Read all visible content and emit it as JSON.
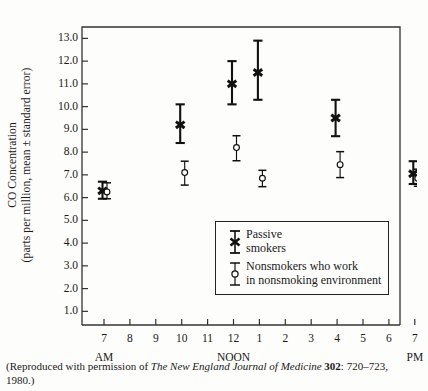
{
  "axes": {
    "y_title_line1": "CO Concentration",
    "y_title_line2": "(parts per million, mean ± standard error)",
    "y_ticks": [
      "13.0",
      "12.0",
      "11.0",
      "10.0",
      "9.0",
      "8.0",
      "7.0",
      "6.0",
      "5.0",
      "4.0",
      "3.0",
      "2.0",
      "1.0"
    ],
    "x_ticks": [
      "7",
      "8",
      "9",
      "10",
      "11",
      "12",
      "1",
      "2",
      "3",
      "4",
      "5",
      "6",
      "7"
    ],
    "period_am": "AM",
    "period_noon": "NOON",
    "period_pm": "PM"
  },
  "legend": {
    "series1_line1": "Passive",
    "series1_line2": "smokers",
    "series2_line1": "Nonsmokers who work",
    "series2_line2": "in nonsmoking environment"
  },
  "caption": {
    "pre": "(Reproduced with permission of ",
    "journal": "The New England Journal of Medicine",
    "volume": "302",
    "post": ": 720–723, 1980.)"
  },
  "colors": {
    "ink": "#1a1a1a",
    "frame": "#333333",
    "paper": "#fdfdfb"
  },
  "chart_data": {
    "type": "scatter",
    "title": "",
    "xlabel": "Time of day",
    "ylabel": "CO Concentration (parts per million, mean ± standard error)",
    "ylim": [
      0.4,
      13.5
    ],
    "xlim_hours": [
      "7 AM",
      "7 PM"
    ],
    "grid": false,
    "legend_position": "inside-lower-right",
    "x_categories": [
      "7 AM",
      "8 AM",
      "9 AM",
      "10 AM",
      "11 AM",
      "12 NOON",
      "1 PM",
      "2 PM",
      "3 PM",
      "4 PM",
      "5 PM",
      "6 PM",
      "7 PM"
    ],
    "series": [
      {
        "name": "Passive smokers",
        "marker": "filled-x",
        "points": [
          {
            "x_label": "7 AM",
            "x_index": 0,
            "y": 6.3,
            "lo": 5.95,
            "hi": 6.7
          },
          {
            "x_label": "10 AM",
            "x_index": 3,
            "y": 9.2,
            "lo": 8.4,
            "hi": 10.1
          },
          {
            "x_label": "12 NOON",
            "x_index": 5,
            "y": 11.0,
            "lo": 10.1,
            "hi": 12.0
          },
          {
            "x_label": "1 PM",
            "x_index": 6,
            "y": 11.5,
            "lo": 10.3,
            "hi": 12.9
          },
          {
            "x_label": "4 PM",
            "x_index": 9,
            "y": 9.5,
            "lo": 8.7,
            "hi": 10.3
          },
          {
            "x_label": "7 PM",
            "x_index": 12,
            "y": 7.05,
            "lo": 6.6,
            "hi": 7.6
          }
        ]
      },
      {
        "name": "Nonsmokers who work in nonsmoking environment",
        "marker": "open-circle",
        "points": [
          {
            "x_label": "7 AM",
            "x_index": 0,
            "y": 6.25,
            "lo": 5.95,
            "hi": 6.65
          },
          {
            "x_label": "10 AM",
            "x_index": 3,
            "y": 7.1,
            "lo": 6.55,
            "hi": 7.6
          },
          {
            "x_label": "12 NOON",
            "x_index": 5,
            "y": 8.2,
            "lo": 7.62,
            "hi": 8.72
          },
          {
            "x_label": "1 PM",
            "x_index": 6,
            "y": 6.85,
            "lo": 6.48,
            "hi": 7.2
          },
          {
            "x_label": "4 PM",
            "x_index": 9,
            "y": 7.45,
            "lo": 6.88,
            "hi": 8.02
          },
          {
            "x_label": "7 PM",
            "x_index": 12,
            "y": 6.85,
            "lo": 6.5,
            "hi": 7.25
          }
        ]
      }
    ]
  }
}
